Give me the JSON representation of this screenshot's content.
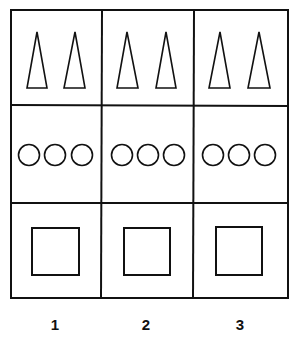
{
  "diagram": {
    "rows": [
      {
        "shape": "triangle",
        "count_per_cell": 2
      },
      {
        "shape": "circle",
        "count_per_cell": 3
      },
      {
        "shape": "square",
        "count_per_cell": 1
      }
    ],
    "columns": [
      {
        "label": "1"
      },
      {
        "label": "2"
      },
      {
        "label": "3"
      }
    ],
    "stroke_color": "#111111",
    "background": "#ffffff"
  }
}
